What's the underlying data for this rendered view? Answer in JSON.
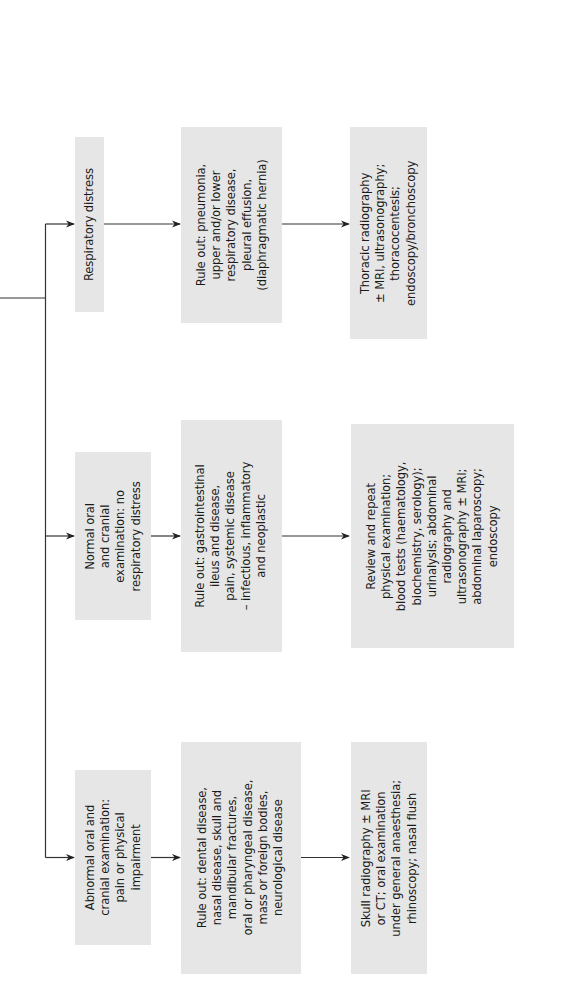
{
  "diagram": {
    "orientation": "rotated 90 degrees counter-clockwise",
    "colors": {
      "box_fill": "#e6e6e6",
      "line": "#333333",
      "background": "#ffffff"
    },
    "branches": [
      {
        "id": "respiratory",
        "presentation": "Respiratory distress",
        "rule_out": "Rule out: pneumonia,\nupper and/or lower\nrespiratory disease,\npleural effusion,\n(diaphragmatic hernia)",
        "investigations": "Thoracic  radiography\n± MRI, ultrasonography;\nthoracocentesis;\nendoscopy/bronchoscopy"
      },
      {
        "id": "normal",
        "presentation": "Normal oral\nand cranial\nexamination: no\nrespiratory distress",
        "rule_out": "Rule out: gastrointestinal\nileus and disease,\npain, systemic disease\n– infectious, inflammatory\nand neoplastic",
        "investigations": "Review and repeat\nphysical examination;\nblood tests (haematology,\nbiochemistry, serology);\nurinalysis; abdominal\nradiography and\nultrasonography ± MRI;\nabdominal laparoscopy;\nendoscopy"
      },
      {
        "id": "abnormal",
        "presentation": "Abnormal oral and\ncranial examination:\npain or physical\nimpairment",
        "rule_out": "Rule out: dental disease,\nnasal disease, skull and\nmandibular fractures,\noral or pharyngeal disease,\nmass or foreign bodies,\nneurological disease",
        "investigations": "Skull radiography ± MRI\nor CT; oral examination\nunder general anaesthesia;\nrhinoscopy; nasal flush"
      }
    ]
  }
}
